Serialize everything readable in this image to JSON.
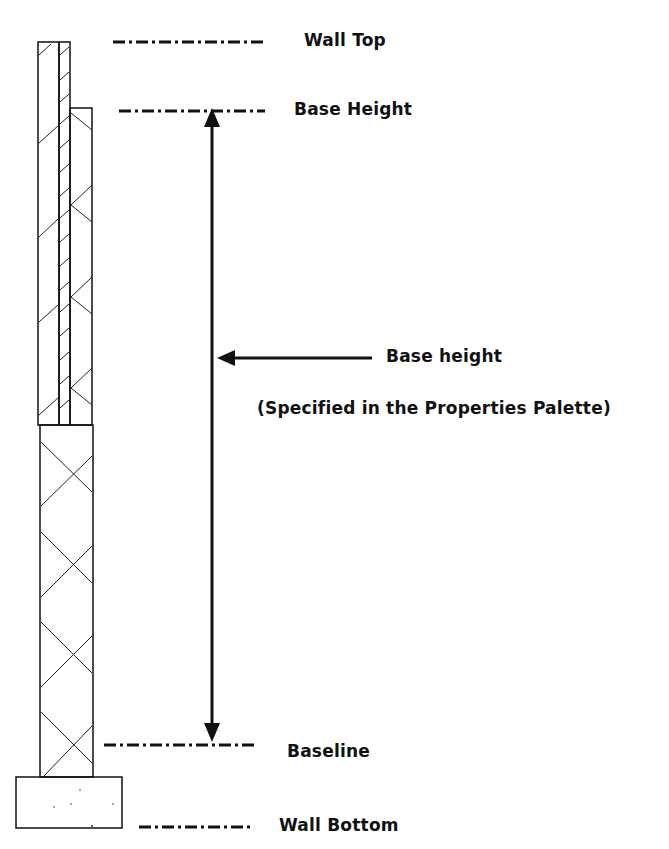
{
  "diagram": {
    "labels": {
      "wall_top": "Wall Top",
      "base_height": "Base Height",
      "base_height_pointer": "Base height",
      "specified_note": "(Specified in the Properties Palette)",
      "baseline": "Baseline",
      "wall_bottom": "Wall Bottom"
    },
    "colors": {
      "line": "#111111",
      "background": "#ffffff"
    }
  }
}
